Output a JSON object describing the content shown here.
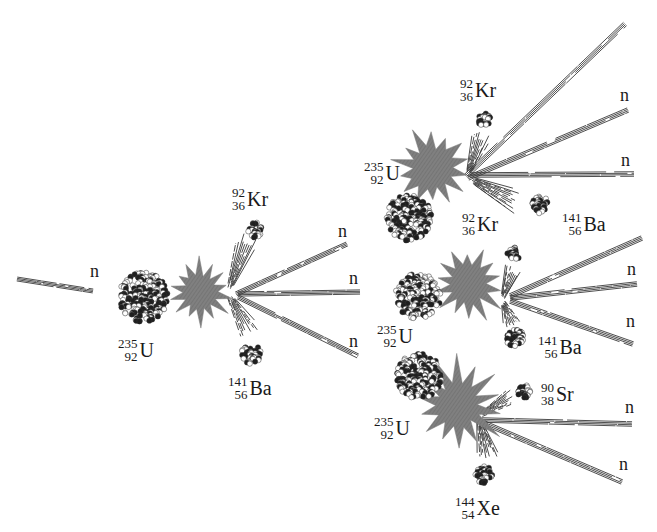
{
  "colors": {
    "burst": "#7a7a7a",
    "nucleon_dark": "#1e1e1e",
    "nucleon_light": "#ffffff",
    "track": "#3a3a3a",
    "text": "#1a1a1a"
  },
  "neutron_symbol": "n",
  "stages": [
    {
      "id": "initial",
      "incoming": "n",
      "target": {
        "symbol": "U",
        "mass": "235",
        "atomic": "92"
      },
      "products": [
        {
          "symbol": "Kr",
          "mass": "92",
          "atomic": "36"
        },
        {
          "symbol": "Ba",
          "mass": "141",
          "atomic": "56"
        }
      ],
      "neutrons_released": [
        "n",
        "n",
        "n"
      ]
    },
    {
      "id": "branch-top",
      "target": {
        "symbol": "U",
        "mass": "235",
        "atomic": "92"
      },
      "products": [
        {
          "symbol": "Kr",
          "mass": "92",
          "atomic": "36"
        },
        {
          "symbol": "Ba",
          "mass": "141",
          "atomic": "56"
        }
      ],
      "neutrons_released": [
        "n",
        "n"
      ]
    },
    {
      "id": "branch-middle",
      "target": {
        "symbol": "U",
        "mass": "235",
        "atomic": "92"
      },
      "products": [
        {
          "symbol": "Kr",
          "mass": "92",
          "atomic": "36"
        },
        {
          "symbol": "Ba",
          "mass": "141",
          "atomic": "56"
        }
      ],
      "neutrons_released": [
        "n",
        "n"
      ]
    },
    {
      "id": "branch-bottom",
      "target": {
        "symbol": "U",
        "mass": "235",
        "atomic": "92"
      },
      "products": [
        {
          "symbol": "Sr",
          "mass": "90",
          "atomic": "38"
        },
        {
          "symbol": "Xe",
          "mass": "144",
          "atomic": "54"
        }
      ],
      "neutrons_released": [
        "n",
        "n"
      ]
    }
  ]
}
